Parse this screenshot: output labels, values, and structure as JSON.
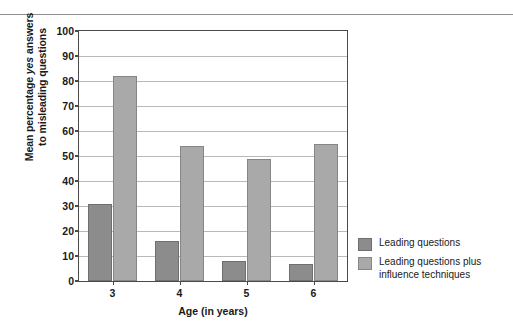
{
  "figure": {
    "top_rule": true
  },
  "chart_data": {
    "type": "bar",
    "title": "",
    "xlabel": "Age (in years)",
    "ylabel_line1": "Mean percentage yes answers",
    "ylabel_line2": "to misleading questions",
    "ylabel_italic_word": "yes",
    "ylabel_prefix": "Mean percentage ",
    "ylabel_suffix": " answers",
    "categories": [
      "3",
      "4",
      "5",
      "6"
    ],
    "series": [
      {
        "name": "Leading questions",
        "values": [
          31,
          16,
          8,
          7
        ],
        "color": "#8c8c8c"
      },
      {
        "name": "Leading questions plus influence techniques",
        "values": [
          82,
          54,
          49,
          55
        ],
        "color": "#a9a9a9"
      }
    ],
    "ylim": [
      0,
      100
    ],
    "yticks": [
      0,
      10,
      20,
      30,
      40,
      50,
      60,
      70,
      80,
      90,
      100
    ],
    "ytick_labels": [
      "0",
      "10",
      "20",
      "30",
      "40",
      "50",
      "60",
      "70",
      "80",
      "90",
      "100"
    ],
    "grid": true,
    "legend_position": "right",
    "legend": [
      {
        "label": "Leading questions",
        "label_line2": ""
      },
      {
        "label": "Leading questions plus",
        "label_line2": "influence techniques"
      }
    ]
  }
}
